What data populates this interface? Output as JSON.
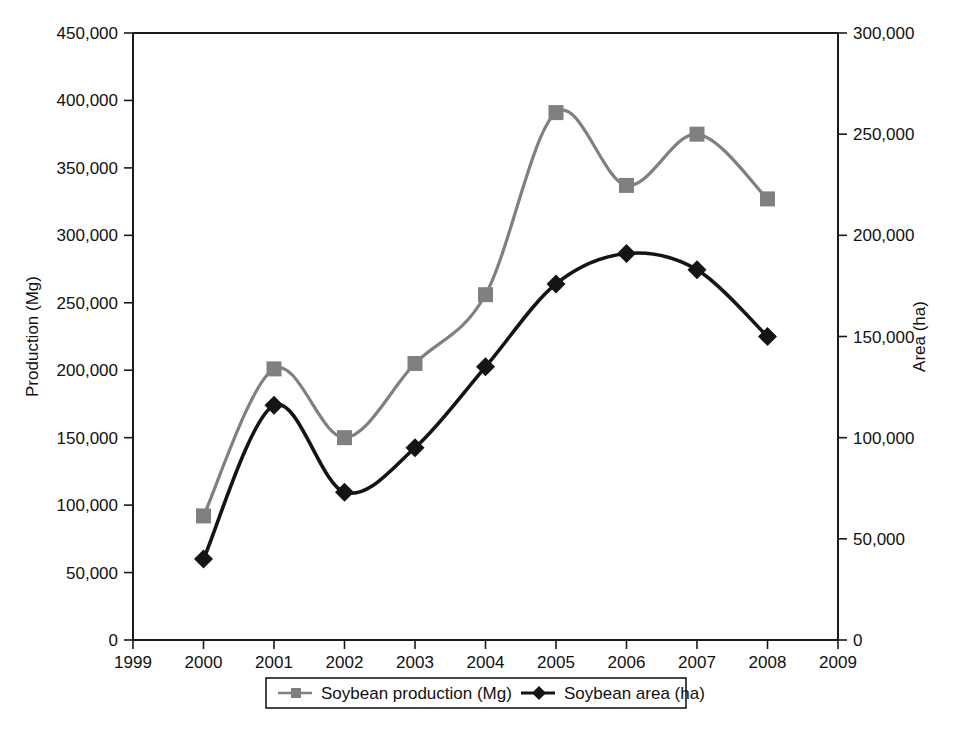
{
  "figure": {
    "background_color": "#ffffff",
    "plot_background_color": "#ffffff",
    "frame_color": "#1a1a1a"
  },
  "chart_data": {
    "type": "line",
    "title": "",
    "xlabel": "",
    "categories": [
      2000,
      2001,
      2002,
      2003,
      2004,
      2005,
      2006,
      2007,
      2008
    ],
    "x_tick_labels": [
      "1999",
      "2000",
      "2001",
      "2002",
      "2003",
      "2004",
      "2005",
      "2006",
      "2007",
      "2008",
      "2009"
    ],
    "xlim": [
      1999,
      2009
    ],
    "grid": false,
    "legend_position": "bottom-center",
    "axes": [
      {
        "id": "left",
        "label": "Production (Mg)",
        "lim": [
          0,
          450000
        ],
        "tick_step": 50000,
        "tick_labels": [
          "0",
          "50,000",
          "100,000",
          "150,000",
          "200,000",
          "250,000",
          "300,000",
          "350,000",
          "400,000",
          "450,000"
        ]
      },
      {
        "id": "right",
        "label": "Area (ha)",
        "lim": [
          0,
          300000
        ],
        "tick_step": 50000,
        "tick_labels": [
          "0",
          "50,000",
          "100,000",
          "150,000",
          "200,000",
          "250,000",
          "300,000"
        ]
      }
    ],
    "series": [
      {
        "name": "Soybean production (Mg)",
        "axis": "left",
        "color": "#808080",
        "marker": "square",
        "values": [
          92000,
          201000,
          150000,
          205000,
          256000,
          391000,
          337000,
          375000,
          327000
        ]
      },
      {
        "name": "Soybean area (ha)",
        "axis": "right",
        "color": "#141414",
        "marker": "diamond",
        "values": [
          40000,
          116000,
          73000,
          95000,
          135000,
          176000,
          191000,
          183000,
          150000
        ]
      }
    ]
  },
  "legend": {
    "entries": [
      {
        "label": "Soybean production (Mg)",
        "marker": "square-marker",
        "color": "#808080"
      },
      {
        "label": "Soybean area (ha)",
        "marker": "diamond-marker",
        "color": "#141414"
      }
    ]
  },
  "caption": {
    "text": ""
  }
}
